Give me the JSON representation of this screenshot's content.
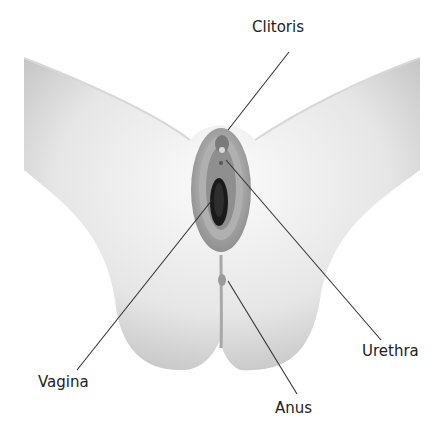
{
  "diagram": {
    "type": "anatomical-illustration",
    "labels": [
      {
        "id": "clitoris",
        "text": "Clitoris",
        "x": 252,
        "y": 18
      },
      {
        "id": "urethra",
        "text": "Urethra",
        "x": 362,
        "y": 342
      },
      {
        "id": "vagina",
        "text": "Vagina",
        "x": 38,
        "y": 373
      },
      {
        "id": "anus",
        "text": "Anus",
        "x": 275,
        "y": 399
      }
    ],
    "leader_lines": [
      {
        "for": "clitoris",
        "x1": 289,
        "y1": 52,
        "x2": 228,
        "y2": 130
      },
      {
        "for": "urethra",
        "x1": 381,
        "y1": 340,
        "x2": 226,
        "y2": 160
      },
      {
        "for": "vagina",
        "x1": 77,
        "y1": 370,
        "x2": 212,
        "y2": 200
      },
      {
        "for": "anus",
        "x1": 297,
        "y1": 394,
        "x2": 228,
        "y2": 281
      }
    ],
    "colors": {
      "skin_light": "#f2f2f2",
      "skin_shade": "#b8b8b8",
      "line": "#333333",
      "dark": "#1a1a1a"
    }
  }
}
